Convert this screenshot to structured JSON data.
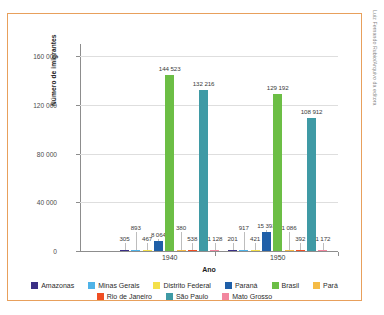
{
  "credit": "Luiz Fernando Rubio/Arquivo da editora",
  "chart_data": {
    "type": "bar",
    "title": "",
    "xlabel": "Ano",
    "ylabel": "Número de imigrantes",
    "categories": [
      "1940",
      "1950"
    ],
    "ylim": [
      0,
      170000
    ],
    "yticks": [
      0,
      40000,
      80000,
      120000,
      160000
    ],
    "ytick_labels": [
      "0",
      "40 000",
      "80 000",
      "120 000",
      "160 000"
    ],
    "grid": true,
    "legend_position": "bottom",
    "series": [
      {
        "name": "Amazonas",
        "color": "#3b2f85",
        "values": [
          305,
          201
        ],
        "labels": [
          "305",
          "201"
        ]
      },
      {
        "name": "Minas Gerais",
        "color": "#4fb3e8",
        "values": [
          893,
          917
        ],
        "labels": [
          "893",
          "917"
        ]
      },
      {
        "name": "Distrito Federal",
        "color": "#f4e04a",
        "values": [
          467,
          421
        ],
        "labels": [
          "467",
          "421"
        ]
      },
      {
        "name": "Paraná",
        "color": "#1f5fa8",
        "values": [
          8064,
          15393
        ],
        "labels": [
          "8 064",
          "15 393"
        ]
      },
      {
        "name": "Brasil",
        "color": "#6cbe45",
        "values": [
          144523,
          129192
        ],
        "labels": [
          "144 523",
          "129 192"
        ]
      },
      {
        "name": "Pará",
        "color": "#f5bb45",
        "values": [
          380,
          1086
        ],
        "labels": [
          "380",
          "1 086"
        ]
      },
      {
        "name": "Rio de Janeiro",
        "color": "#f04e23",
        "values": [
          538,
          392
        ],
        "labels": [
          "538",
          "392"
        ]
      },
      {
        "name": "São Paulo",
        "color": "#3f9aa5",
        "values": [
          132216,
          108912
        ],
        "labels": [
          "132 216",
          "108 912"
        ]
      },
      {
        "name": "Mato Grosso",
        "color": "#f2879f",
        "values": [
          1128,
          1172
        ],
        "labels": [
          "1 128",
          "1 172"
        ]
      }
    ]
  }
}
